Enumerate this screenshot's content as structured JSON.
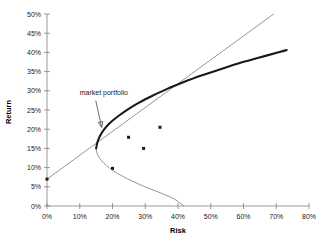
{
  "chart_data": {
    "type": "scatter",
    "title": "",
    "xlabel": "Risk",
    "ylabel": "Return",
    "xlim": [
      0,
      80
    ],
    "ylim": [
      0,
      50
    ],
    "grid": false,
    "legend": "none",
    "x_tick_labels": [
      "0%",
      "10%",
      "20%",
      "30%",
      "40%",
      "50%",
      "60%",
      "70%",
      "80%"
    ],
    "y_tick_labels": [
      "0%",
      "5%",
      "10%",
      "15%",
      "20%",
      "25%",
      "30%",
      "35%",
      "40%",
      "45%",
      "50%"
    ],
    "x_ticks": [
      0,
      10,
      20,
      30,
      40,
      50,
      60,
      70,
      80
    ],
    "y_ticks": [
      0,
      5,
      10,
      15,
      20,
      25,
      30,
      35,
      40,
      45,
      50
    ],
    "annotations": [
      {
        "text": "market portfolio",
        "x": 10,
        "y": 29,
        "points_to_x": 17,
        "points_to_y": 19.7
      }
    ],
    "series": [
      {
        "name": "individual assets",
        "type": "scatter",
        "points": [
          {
            "x": 0,
            "y": 7
          },
          {
            "x": 20,
            "y": 9.8
          },
          {
            "x": 24.9,
            "y": 17.9
          },
          {
            "x": 29.5,
            "y": 15.0
          },
          {
            "x": 34.5,
            "y": 20.5
          }
        ]
      },
      {
        "name": "efficient frontier",
        "type": "line",
        "style": "thick",
        "points": [
          {
            "x": 15.0,
            "y": 15.0
          },
          {
            "x": 15.4,
            "y": 16.6
          },
          {
            "x": 16.2,
            "y": 18.3
          },
          {
            "x": 17.4,
            "y": 19.9
          },
          {
            "x": 19.2,
            "y": 21.6
          },
          {
            "x": 21.6,
            "y": 23.3
          },
          {
            "x": 24.6,
            "y": 25.1
          },
          {
            "x": 28.1,
            "y": 26.9
          },
          {
            "x": 32.2,
            "y": 28.7
          },
          {
            "x": 36.7,
            "y": 30.5
          },
          {
            "x": 41.6,
            "y": 32.2
          },
          {
            "x": 46.9,
            "y": 33.9
          },
          {
            "x": 52.5,
            "y": 35.5
          },
          {
            "x": 58.4,
            "y": 37.1
          },
          {
            "x": 64.6,
            "y": 38.6
          },
          {
            "x": 71.0,
            "y": 40.1
          },
          {
            "x": 73.2,
            "y": 40.6
          }
        ]
      },
      {
        "name": "inefficient frontier",
        "type": "line",
        "style": "thin",
        "points": [
          {
            "x": 15.0,
            "y": 15.0
          },
          {
            "x": 15.3,
            "y": 13.7
          },
          {
            "x": 16.1,
            "y": 12.4
          },
          {
            "x": 17.4,
            "y": 11.1
          },
          {
            "x": 19.2,
            "y": 9.8
          },
          {
            "x": 21.5,
            "y": 8.5
          },
          {
            "x": 24.3,
            "y": 7.2
          },
          {
            "x": 27.5,
            "y": 5.9
          },
          {
            "x": 31.1,
            "y": 4.6
          },
          {
            "x": 35.0,
            "y": 3.3
          },
          {
            "x": 38.9,
            "y": 1.8
          },
          {
            "x": 41.8,
            "y": 0.0
          }
        ]
      },
      {
        "name": "capital market line",
        "type": "line",
        "style": "thin",
        "points": [
          {
            "x": 0,
            "y": 7
          },
          {
            "x": 69.2,
            "y": 50
          }
        ]
      }
    ]
  }
}
